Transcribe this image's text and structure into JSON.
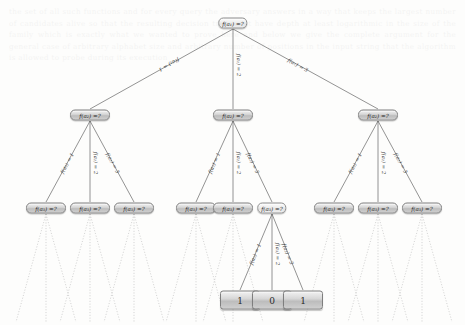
{
  "figure": {
    "kind": "query-decision-tree",
    "background_color": "#fdfdfc",
    "node_border_color": "#7e7e7e",
    "edge_color": "#595959",
    "dotted_edge_color": "#c9c9c9"
  },
  "bleed_text": "the set of all such functions and for every query the adversary answers in a way that keeps the largest number of candidates alive so that the resulting decision tree must have depth at least logarithmic in the size of the family which is exactly what we wanted to prove here and below we give the complete argument for the general case of arbitrary alphabet size and arbitrary number of positions in the input string that the algorithm is allowed to probe during its execution",
  "nodes": {
    "root": {
      "label": "f(a₁) =?",
      "state": "unresolved"
    },
    "level2": [
      {
        "label": "f(a₂) =?",
        "state": "query"
      },
      {
        "label": "f(a₂) =?",
        "state": "query"
      },
      {
        "label": "f(a₂) =?",
        "state": "query"
      }
    ],
    "level3": [
      {
        "label": "f(a₃) =?",
        "state": "query"
      },
      {
        "label": "f(a₃) =?",
        "state": "query"
      },
      {
        "label": "f(a₃) =?",
        "state": "query"
      },
      {
        "label": "f(a₃) =?",
        "state": "query"
      },
      {
        "label": "f(a₃) =?",
        "state": "query"
      },
      {
        "label": "f(a₃) =?",
        "state": "unresolved"
      },
      {
        "label": "f(a₃) =?",
        "state": "query"
      },
      {
        "label": "f(a₃) =?",
        "state": "query"
      },
      {
        "label": "f(a₃) =?",
        "state": "query"
      }
    ],
    "leaves": [
      {
        "label": "1"
      },
      {
        "label": "0"
      },
      {
        "label": "1"
      }
    ]
  },
  "edge_labels": {
    "level1": [
      {
        "text": "f(a₁) = 1"
      },
      {
        "text": "f(a₁) = 2"
      },
      {
        "text": "f(a₁) = 3"
      }
    ],
    "level2": [
      {
        "text": "f(a₂) = 1"
      },
      {
        "text": "f(a₂) = 2"
      },
      {
        "text": "f(a₂) = 3"
      },
      {
        "text": "f(a₂) = 1"
      },
      {
        "text": "f(a₂) = 2"
      },
      {
        "text": "f(a₂) = 3"
      },
      {
        "text": "f(a₂) = 1"
      },
      {
        "text": "f(a₂) = 2"
      },
      {
        "text": "f(a₂) = 3"
      }
    ],
    "level3": [
      {
        "text": "f(a₃) = 1"
      },
      {
        "text": "f(a₃) = 2"
      },
      {
        "text": "f(a₃) = 3"
      }
    ]
  }
}
